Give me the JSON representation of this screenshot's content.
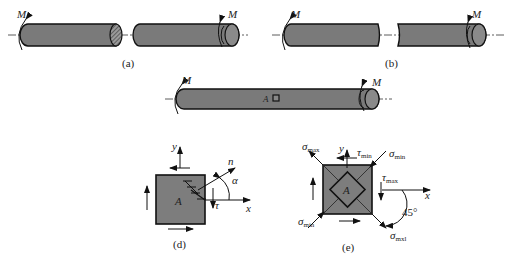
{
  "figure": {
    "colors": {
      "shaft_fill": "#7a7a7a",
      "outline": "#111111",
      "background": "#ffffff"
    }
  },
  "panel_a": {
    "caption": "(a)",
    "moment_left": "M",
    "moment_right": "M"
  },
  "panel_b": {
    "caption": "(b)",
    "moment_left": "M",
    "moment_right": "M"
  },
  "panel_c": {
    "moment_left": "M",
    "moment_right": "M",
    "point_label": "A"
  },
  "panel_d": {
    "caption": "(d)",
    "point_label": "A",
    "axis_x": "x",
    "axis_y": "y",
    "normal": "n",
    "angle": "α",
    "shear": "τ"
  },
  "panel_e": {
    "caption": "(e)",
    "point_label": "A",
    "axis_x": "x",
    "axis_y": "y",
    "angle": "45°",
    "labels": {
      "sigma": "σ",
      "tau": "τ",
      "max": "max",
      "min": "min",
      "mxl": "mxl"
    }
  }
}
